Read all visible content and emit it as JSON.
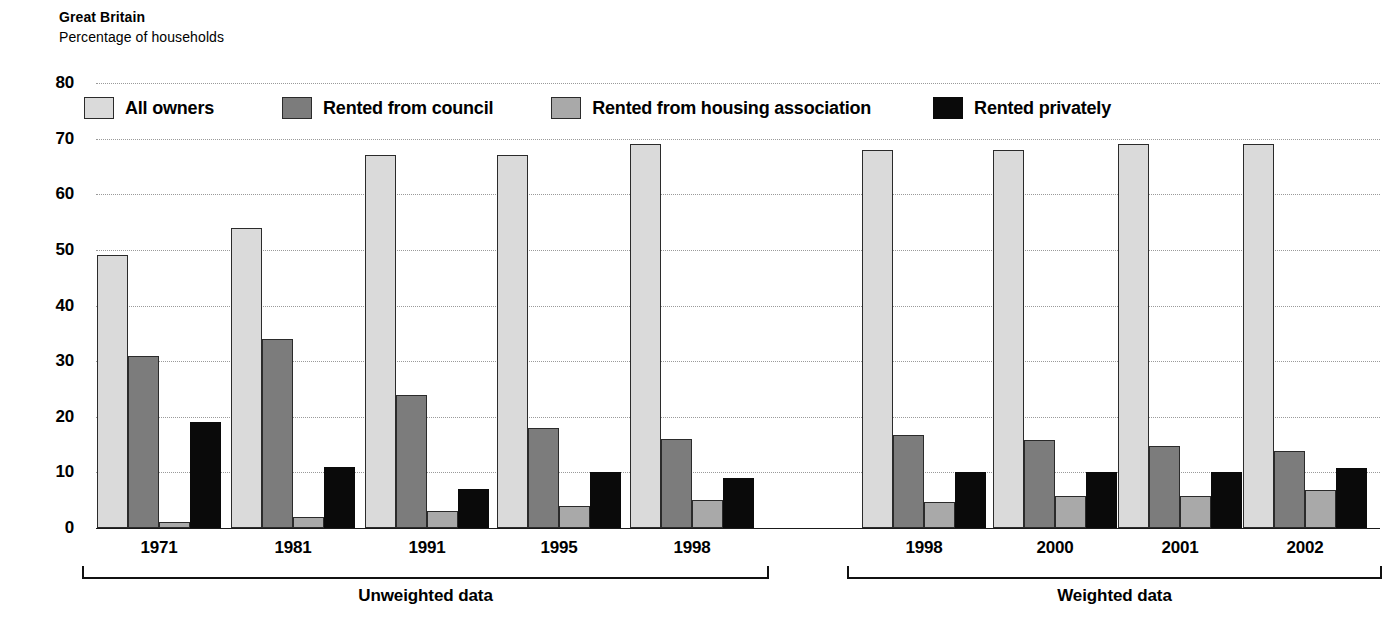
{
  "header": {
    "region": "Great Britain",
    "subtitle": "Percentage of households"
  },
  "legend": [
    {
      "key": "owners",
      "label": "All owners",
      "color": "#dadada",
      "swatch_name": "legend-swatch-all-owners"
    },
    {
      "key": "council",
      "label": "Rented from council",
      "color": "#7c7c7c",
      "swatch_name": "legend-swatch-rented-from-council"
    },
    {
      "key": "housing",
      "label": "Rented from housing association",
      "color": "#a9a9a9",
      "swatch_name": "legend-swatch-rented-from-housing-association"
    },
    {
      "key": "private",
      "label": "Rented privately",
      "color": "#0a0a0a",
      "swatch_name": "legend-swatch-rented-privately"
    }
  ],
  "panels": [
    {
      "label": "Unweighted data",
      "categories": [
        "1971",
        "1981",
        "1991",
        "1995",
        "1998"
      ]
    },
    {
      "label": "Weighted data",
      "categories": [
        "1998",
        "2000",
        "2001",
        "2002"
      ]
    }
  ],
  "chart_data": {
    "type": "bar",
    "title": "Great Britain",
    "subtitle": "Percentage of households",
    "xlabel": "",
    "ylabel": "Percentage of households",
    "ylim": [
      0,
      80
    ],
    "yticks": [
      0,
      10,
      20,
      30,
      40,
      50,
      60,
      70,
      80
    ],
    "grid": true,
    "legend_position": "top-inside",
    "grouping": "grouped-by-year, split into two panels",
    "panel_labels": [
      "Unweighted data",
      "Weighted data"
    ],
    "categories": [
      "1971",
      "1981",
      "1991",
      "1995",
      "1998",
      "1998",
      "2000",
      "2001",
      "2002"
    ],
    "category_panel": [
      "Unweighted data",
      "Unweighted data",
      "Unweighted data",
      "Unweighted data",
      "Unweighted data",
      "Weighted data",
      "Weighted data",
      "Weighted data",
      "Weighted data"
    ],
    "series": [
      {
        "name": "All owners",
        "color": "#dadada",
        "values": [
          49,
          54,
          67,
          67,
          69,
          68,
          68,
          69,
          69
        ]
      },
      {
        "name": "Rented from council",
        "color": "#7c7c7c",
        "values": [
          31,
          34,
          24,
          18,
          16,
          16.7,
          15.8,
          14.7,
          13.8
        ]
      },
      {
        "name": "Rented from housing association",
        "color": "#a9a9a9",
        "values": [
          1,
          2,
          3,
          4,
          5,
          4.7,
          5.8,
          5.8,
          6.8
        ]
      },
      {
        "name": "Rented privately",
        "color": "#0a0a0a",
        "values": [
          19,
          11,
          7,
          10,
          9,
          10,
          10,
          10,
          10.8
        ]
      }
    ]
  }
}
